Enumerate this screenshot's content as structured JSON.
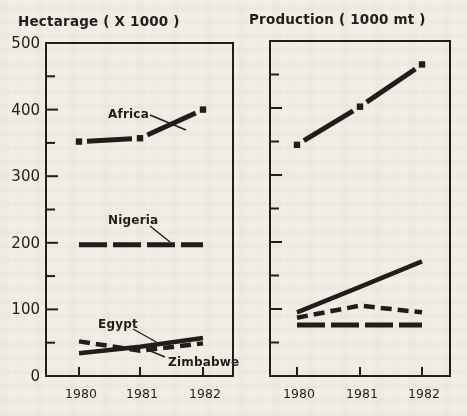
{
  "colors": {
    "ink": "#211e19",
    "paper": "#f2efe8"
  },
  "chart_data": [
    {
      "type": "line",
      "panel": "left",
      "title": "Hectarage ( X 1000 )",
      "x": [
        1980,
        1981,
        1982
      ],
      "xtick_labels": [
        "1980",
        "1981",
        "1982"
      ],
      "ylim": [
        0,
        500
      ],
      "ytick_labels": [
        "0",
        "100",
        "200",
        "300",
        "400",
        "500"
      ],
      "minor_ytick_step": 50,
      "grid": "off",
      "legend": "inline-labels",
      "series": [
        {
          "name": "Africa",
          "values": [
            352,
            357,
            400
          ],
          "style": "thick-dot-joint"
        },
        {
          "name": "Nigeria",
          "values": [
            197,
            197,
            197
          ],
          "style": "long-dash"
        },
        {
          "name": "Egypt",
          "values": [
            34,
            44,
            57
          ],
          "style": "solid"
        },
        {
          "name": "Zimbabwe",
          "values": [
            52,
            38,
            49
          ],
          "style": "short-dash"
        }
      ]
    },
    {
      "type": "line",
      "panel": "right",
      "title": "Production ( 1000 mt )",
      "x": [
        1980,
        1981,
        1982
      ],
      "xtick_labels": [
        "1980",
        "1981",
        "1982"
      ],
      "ylim": [
        0,
        500
      ],
      "ytick_labels": [],
      "minor_ytick_step": 50,
      "grid": "off",
      "legend": "none",
      "series": [
        {
          "name": "Africa",
          "values": [
            345,
            402,
            465
          ],
          "style": "thick-dot-joint"
        },
        {
          "name": "Egypt",
          "values": [
            95,
            133,
            171
          ],
          "style": "solid"
        },
        {
          "name": "Zimbabwe",
          "values": [
            87,
            105,
            95
          ],
          "style": "short-dash"
        },
        {
          "name": "Nigeria",
          "values": [
            76,
            76,
            76
          ],
          "style": "long-dash"
        }
      ]
    }
  ]
}
